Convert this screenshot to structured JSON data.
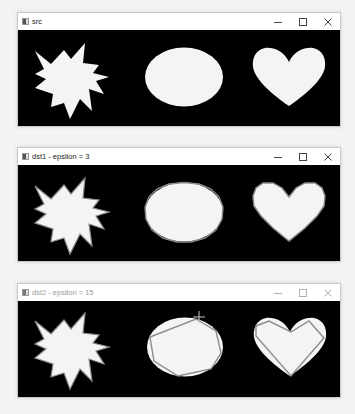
{
  "windows": [
    {
      "title": "src",
      "active": true,
      "controls": {
        "minimize": "minimize",
        "maximize": "maximize",
        "close": "close"
      },
      "image_description": "white starburst, white ellipse, white heart on black background",
      "outline": "none"
    },
    {
      "title": "dst1 - epsilon = 3",
      "active": true,
      "controls": {
        "minimize": "minimize",
        "maximize": "maximize",
        "close": "close"
      },
      "image_description": "shapes with approximated polygon contours drawn in grey",
      "outline": "epsilon 3 approximation"
    },
    {
      "title": "dst2 - epsilon = 15",
      "active": false,
      "controls": {
        "minimize": "minimize",
        "maximize": "maximize",
        "close": "close"
      },
      "image_description": "shapes with coarse approximated polygon contours drawn in grey",
      "outline": "epsilon 15 approximation"
    }
  ],
  "colors": {
    "shape_fill": "#f4f4f4",
    "contour_stroke": "#8c8c8c",
    "canvas_bg": "#000000"
  },
  "cursor": {
    "type": "crosshair",
    "window": 2
  }
}
